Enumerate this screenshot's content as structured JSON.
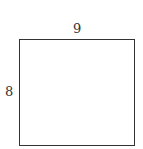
{
  "diagram": {
    "shape": "rectangle",
    "labels": {
      "top": "9",
      "left": "8"
    },
    "stroke_color": "#333333",
    "background": "#ffffff"
  }
}
